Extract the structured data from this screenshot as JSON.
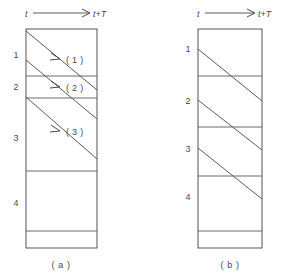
{
  "figure": {
    "background_color": "#ffffff",
    "line_color": "#555555",
    "text_color": "#4a4a4a",
    "panels": [
      {
        "id": "panel-a",
        "caption": "( a )",
        "axis": {
          "start_label": "t",
          "end_label": "t+T",
          "arrow_direction": "right"
        },
        "row_labels": [
          "1",
          "2",
          "3",
          "4"
        ],
        "flow_tags": [
          "( 1 )",
          "( 2 )",
          "( 3 )"
        ],
        "box": {
          "left": 26,
          "top": 29,
          "right": 97,
          "bottom": 248
        },
        "dividers_y": [
          76,
          98,
          171,
          231
        ],
        "row_label_y": [
          58,
          87,
          140,
          205
        ],
        "diagonals": [
          {
            "x1": 26,
            "y1": 31,
            "x2": 97,
            "y2": 90
          },
          {
            "x1": 26,
            "y1": 60,
            "x2": 97,
            "y2": 119
          },
          {
            "x1": 26,
            "y1": 97,
            "x2": 97,
            "y2": 159
          }
        ],
        "tag_arrows": [
          {
            "x": 56,
            "y": 56,
            "label_x": 70,
            "label_y": 62
          },
          {
            "x": 56,
            "y": 84,
            "label_x": 70,
            "label_y": 90
          },
          {
            "x": 56,
            "y": 128,
            "label_x": 70,
            "label_y": 134
          }
        ]
      },
      {
        "id": "panel-b",
        "caption": "( b )",
        "axis": {
          "start_label": "t",
          "end_label": "t+T",
          "arrow_direction": "right"
        },
        "row_labels": [
          "1",
          "2",
          "3",
          "4"
        ],
        "flow_tags": [],
        "box": {
          "left": 198,
          "top": 29,
          "right": 262,
          "bottom": 248
        },
        "dividers_y": [
          76,
          127,
          176,
          231
        ],
        "row_label_y": [
          52,
          104,
          152,
          200
        ],
        "diagonals": [
          {
            "x1": 198,
            "y1": 49,
            "x2": 262,
            "y2": 101
          },
          {
            "x1": 198,
            "y1": 100,
            "x2": 262,
            "y2": 150
          },
          {
            "x1": 198,
            "y1": 148,
            "x2": 262,
            "y2": 199
          }
        ],
        "tag_arrows": []
      }
    ]
  }
}
